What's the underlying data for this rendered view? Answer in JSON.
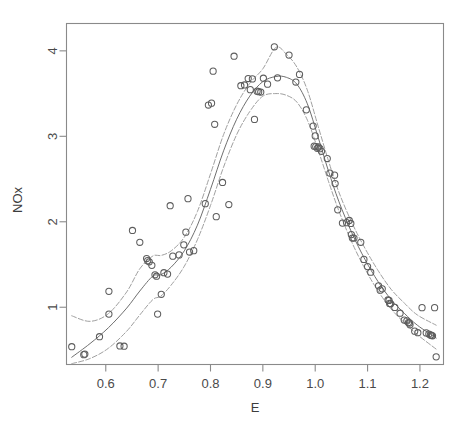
{
  "figure": {
    "background_color": "#ffffff",
    "frame_color": "#8a8a8a",
    "point_color": "#5d5d5d",
    "fit_color": "#6f6f6f",
    "band_color": "#9a9a9a"
  },
  "axes": {
    "x_title": "E",
    "y_title": "NOx",
    "x_ticks": [
      "0.6",
      "0.7",
      "0.8",
      "0.9",
      "1.0",
      "1.1",
      "1.2"
    ],
    "y_ticks": [
      "1",
      "2",
      "3",
      "4"
    ]
  },
  "chart_data": {
    "type": "scatter",
    "title": "",
    "subtitle": "",
    "xlabel": "E",
    "ylabel": "NOx",
    "xlim": [
      0.525,
      1.245
    ],
    "ylim": [
      0.33,
      4.32
    ],
    "xticks": [
      0.6,
      0.7,
      0.8,
      0.9,
      1.0,
      1.1,
      1.2
    ],
    "yticks": [
      1,
      2,
      3,
      4
    ],
    "grid": false,
    "legend": null,
    "legend_position": "none",
    "annotations": [],
    "points": {
      "name": "observations",
      "marker": "open-circle",
      "x": [
        0.535,
        0.558,
        0.56,
        0.588,
        0.606,
        0.606,
        0.627,
        0.635,
        0.651,
        0.665,
        0.678,
        0.68,
        0.683,
        0.688,
        0.694,
        0.697,
        0.699,
        0.706,
        0.711,
        0.718,
        0.723,
        0.728,
        0.74,
        0.749,
        0.753,
        0.757,
        0.76,
        0.768,
        0.79,
        0.796,
        0.802,
        0.805,
        0.808,
        0.811,
        0.823,
        0.835,
        0.845,
        0.858,
        0.865,
        0.872,
        0.876,
        0.88,
        0.884,
        0.889,
        0.892,
        0.896,
        0.901,
        0.909,
        0.922,
        0.928,
        0.95,
        0.963,
        0.97,
        0.983,
        0.996,
        0.998,
        1.0,
        1.001,
        1.004,
        1.006,
        1.009,
        1.012,
        1.023,
        1.028,
        1.037,
        1.038,
        1.043,
        1.052,
        1.06,
        1.065,
        1.068,
        1.069,
        1.071,
        1.074,
        1.087,
        1.093,
        1.1,
        1.106,
        1.121,
        1.124,
        1.128,
        1.139,
        1.141,
        1.142,
        1.144,
        1.152,
        1.162,
        1.17,
        1.175,
        1.178,
        1.18,
        1.181,
        1.19,
        1.196,
        1.204,
        1.212,
        1.217,
        1.22,
        1.222,
        1.224,
        1.228,
        1.231
      ],
      "y": [
        0.538,
        0.445,
        0.452,
        0.655,
        0.92,
        1.186,
        0.547,
        0.544,
        1.898,
        1.76,
        1.57,
        1.545,
        1.532,
        1.49,
        1.38,
        1.363,
        0.92,
        1.152,
        1.404,
        1.388,
        2.188,
        1.598,
        1.612,
        1.73,
        1.878,
        2.27,
        1.646,
        1.662,
        2.212,
        3.366,
        3.388,
        3.762,
        3.141,
        2.06,
        2.46,
        2.202,
        3.937,
        3.592,
        3.601,
        3.676,
        3.546,
        3.672,
        3.198,
        3.528,
        3.522,
        3.518,
        3.68,
        3.61,
        4.048,
        3.684,
        3.95,
        3.635,
        3.724,
        3.31,
        3.12,
        2.885,
        3.005,
        2.88,
        2.86,
        2.875,
        2.855,
        2.825,
        2.74,
        2.57,
        2.545,
        2.447,
        2.14,
        1.985,
        1.99,
        2.015,
        1.98,
        1.85,
        1.81,
        1.81,
        1.76,
        1.56,
        1.476,
        1.41,
        1.25,
        1.2,
        1.215,
        1.085,
        1.08,
        1.045,
        1.04,
        0.998,
        0.93,
        0.85,
        0.84,
        0.82,
        0.815,
        0.795,
        0.72,
        0.702,
        0.995,
        0.7,
        0.686,
        0.676,
        0.67,
        0.665,
        0.995,
        0.42
      ]
    },
    "series": [
      {
        "name": "fitted smooth",
        "style": "solid",
        "x": [
          0.535,
          0.57,
          0.605,
          0.64,
          0.665,
          0.69,
          0.705,
          0.725,
          0.75,
          0.775,
          0.8,
          0.825,
          0.85,
          0.875,
          0.9,
          0.925,
          0.945,
          0.965,
          0.985,
          1.005,
          1.025,
          1.045,
          1.07,
          1.095,
          1.12,
          1.145,
          1.17,
          1.195,
          1.231
        ],
        "y": [
          0.415,
          0.575,
          0.76,
          0.99,
          1.19,
          1.365,
          1.38,
          1.47,
          1.66,
          1.96,
          2.38,
          2.83,
          3.2,
          3.47,
          3.64,
          3.7,
          3.69,
          3.61,
          3.38,
          3.0,
          2.6,
          2.24,
          1.87,
          1.56,
          1.3,
          1.09,
          0.93,
          0.79,
          0.64
        ]
      },
      {
        "name": "upper confidence band",
        "style": "dashed",
        "x": [
          0.535,
          0.57,
          0.605,
          0.64,
          0.665,
          0.69,
          0.705,
          0.725,
          0.75,
          0.775,
          0.8,
          0.825,
          0.85,
          0.875,
          0.9,
          0.925,
          0.945,
          0.965,
          0.985,
          1.005,
          1.025,
          1.045,
          1.07,
          1.095,
          1.12,
          1.145,
          1.17,
          1.195,
          1.231
        ],
        "y": [
          0.9,
          0.835,
          0.925,
          1.18,
          1.45,
          1.6,
          1.605,
          1.66,
          1.82,
          2.12,
          2.56,
          3.02,
          3.37,
          3.62,
          3.79,
          4.04,
          3.96,
          3.81,
          3.54,
          3.13,
          2.72,
          2.35,
          1.99,
          1.69,
          1.43,
          1.21,
          1.05,
          0.91,
          0.79
        ]
      },
      {
        "name": "lower confidence band",
        "style": "dashed",
        "x": [
          0.535,
          0.57,
          0.605,
          0.64,
          0.665,
          0.69,
          0.705,
          0.725,
          0.75,
          0.775,
          0.8,
          0.825,
          0.85,
          0.875,
          0.9,
          0.925,
          0.945,
          0.965,
          0.985,
          1.005,
          1.025,
          1.045,
          1.07,
          1.095,
          1.12,
          1.145,
          1.17,
          1.195,
          1.231
        ],
        "y": [
          0.34,
          0.4,
          0.52,
          0.72,
          0.91,
          1.09,
          1.13,
          1.26,
          1.48,
          1.79,
          2.19,
          2.64,
          3.02,
          3.29,
          3.47,
          3.5,
          3.48,
          3.4,
          3.19,
          2.85,
          2.48,
          2.13,
          1.76,
          1.45,
          1.19,
          0.98,
          0.82,
          0.68,
          0.51
        ]
      }
    ]
  }
}
